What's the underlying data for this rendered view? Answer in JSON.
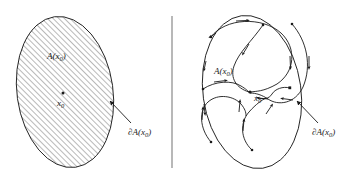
{
  "figure": {
    "name": "region-of-attraction-diagram",
    "width": 347,
    "height": 180,
    "background_color": "#ffffff",
    "ink_color": "#1a1a1a",
    "hatch_color": "#5a5a5a",
    "divider_color": "#9a9a9a"
  },
  "panels": [
    {
      "id": "left-panel",
      "name": "attraction-region-hatched",
      "region_label": "A(x",
      "region_label_sub": "0",
      "region_label_close": ")",
      "equilibrium_label": "x",
      "equilibrium_label_sub": "0",
      "boundary_label_partial": "∂",
      "boundary_label": "A(x",
      "boundary_label_sub": "0",
      "boundary_label_close": ")",
      "fill_style": "diagonal-hatch",
      "hatch_angle_deg": 45,
      "hatch_spacing_px": 4,
      "ellipse": {
        "cx": 65,
        "cy": 92,
        "rx": 48,
        "ry": 76,
        "rotation_deg": -8
      },
      "equilibrium_point": {
        "x": 63,
        "y": 93
      },
      "arrow": {
        "from_x": 131,
        "from_y": 123,
        "to_x": 110,
        "to_y": 101
      }
    },
    {
      "id": "right-panel",
      "name": "attraction-region-trajectories",
      "region_label": "A(x",
      "region_label_sub": "0",
      "region_label_close": ")",
      "equilibrium_label": "x",
      "equilibrium_label_sub": "0",
      "boundary_label_partial": "∂",
      "boundary_label": "A(x",
      "boundary_label_sub": "0",
      "boundary_label_close": ")",
      "fill_style": "none",
      "ellipse": {
        "cx": 252,
        "cy": 92,
        "rx": 49,
        "ry": 77,
        "rotation_deg": -8
      },
      "equilibrium_point": {
        "x": 250,
        "y": 92
      },
      "arrow": {
        "from_x": 318,
        "from_y": 123,
        "to_x": 297,
        "to_y": 101
      },
      "trajectory_count": 5,
      "trajectory_direction": "inward-spiral-to-equilibrium"
    }
  ],
  "divider": {
    "name": "panel-divider",
    "x": 172,
    "y_top": 16,
    "y_bottom": 168
  }
}
